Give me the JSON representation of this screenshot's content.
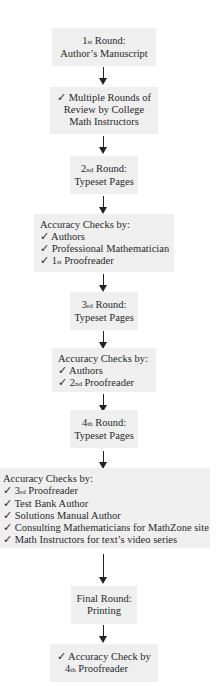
{
  "flowchart": {
    "steps": [
      {
        "id": "round1",
        "lines": [
          {
            "ordinal": "1",
            "suffix": "st",
            "text": " Round:"
          },
          {
            "text": "Author’s Manuscript"
          }
        ]
      },
      {
        "id": "review1",
        "lines": [
          {
            "text": "✓ Multiple Rounds of"
          },
          {
            "text": "Review by College"
          },
          {
            "text": "Math Instructors"
          }
        ]
      },
      {
        "id": "round2",
        "lines": [
          {
            "ordinal": "2",
            "suffix": "nd",
            "text": " Round:"
          },
          {
            "text": "Typeset Pages"
          }
        ]
      },
      {
        "id": "checks2",
        "heading": "Accuracy Checks by:",
        "items": [
          {
            "text": "✓ Authors"
          },
          {
            "text": "✓ Professional Mathematician"
          },
          {
            "prefix": "✓ 1",
            "suffix": "st",
            "text": " Proofreader"
          }
        ]
      },
      {
        "id": "round3",
        "lines": [
          {
            "ordinal": "3",
            "suffix": "rd",
            "text": " Round:"
          },
          {
            "text": "Typeset Pages"
          }
        ]
      },
      {
        "id": "checks3",
        "heading": "Accuracy Checks by:",
        "items": [
          {
            "text": "✓ Authors"
          },
          {
            "prefix": "✓ 2",
            "suffix": "nd",
            "text": " Proofreader"
          }
        ]
      },
      {
        "id": "round4",
        "lines": [
          {
            "ordinal": "4",
            "suffix": "th",
            "text": " Round:"
          },
          {
            "text": "Typeset Pages"
          }
        ]
      },
      {
        "id": "checks4",
        "heading": "Accuracy Checks by:",
        "items": [
          {
            "prefix": "✓ 3",
            "suffix": "rd",
            "text": " Proofreader"
          },
          {
            "text": "✓ Test Bank Author"
          },
          {
            "text": "✓ Solutions Manual Author"
          },
          {
            "text": "✓ Consulting Mathematicians for MathZone site"
          },
          {
            "text": "✓ Math Instructors for text’s video series"
          }
        ]
      },
      {
        "id": "final",
        "lines": [
          {
            "text": "Final Round:"
          },
          {
            "text": "Printing"
          }
        ]
      },
      {
        "id": "checkFinal",
        "lines": [
          {
            "text": "✓ Accuracy Check by"
          },
          {
            "ordinal": "4",
            "suffix": "th",
            "text": " Proofreader"
          }
        ]
      }
    ],
    "colors": {
      "box_fill": "#efefef",
      "text": "#2a2a2a",
      "arrow": "#222222"
    }
  }
}
